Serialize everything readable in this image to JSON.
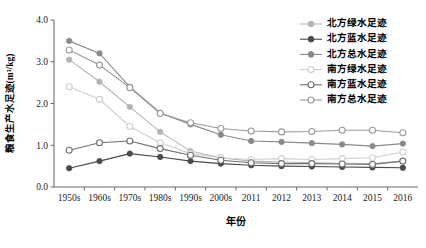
{
  "chart_data": {
    "type": "line",
    "title": "",
    "xlabel": "年份",
    "ylabel": "粮食生产水足迹(m³/kg)",
    "categories": [
      "1950s",
      "1960s",
      "1970s",
      "1980s",
      "1990s",
      "2000s",
      "2011",
      "2012",
      "2013",
      "2014",
      "2015",
      "2016"
    ],
    "ylim": [
      0.0,
      4.0
    ],
    "ytick_labels": [
      "0.0",
      "1.0",
      "2.0",
      "3.0",
      "4.0"
    ],
    "ytick_values": [
      0.0,
      1.0,
      2.0,
      3.0,
      4.0
    ],
    "grid": false,
    "legend_position": "top-right",
    "series": [
      {
        "name": "北方绿水足迹",
        "color": "#b4b4b4",
        "marker": "filled-circle",
        "values": [
          3.05,
          2.52,
          1.92,
          1.32,
          0.86,
          0.7,
          0.62,
          0.6,
          0.58,
          0.57,
          0.56,
          0.62
        ]
      },
      {
        "name": "北方蓝水足迹",
        "color": "#4a4a4a",
        "marker": "filled-circle",
        "values": [
          0.45,
          0.62,
          0.8,
          0.72,
          0.62,
          0.56,
          0.52,
          0.5,
          0.49,
          0.48,
          0.47,
          0.46
        ]
      },
      {
        "name": "北方总水足迹",
        "color": "#8a8a8a",
        "marker": "filled-circle",
        "values": [
          3.5,
          3.2,
          2.4,
          1.78,
          1.5,
          1.25,
          1.1,
          1.08,
          1.05,
          1.02,
          0.98,
          1.04
        ]
      },
      {
        "name": "南方绿水足迹",
        "color": "#cfcfcf",
        "marker": "open-circle",
        "values": [
          2.4,
          2.1,
          1.45,
          1.06,
          0.8,
          0.7,
          0.66,
          0.68,
          0.66,
          0.68,
          0.7,
          0.84
        ]
      },
      {
        "name": "南方蓝水足迹",
        "color": "#707070",
        "marker": "open-circle",
        "values": [
          0.88,
          1.06,
          1.1,
          0.92,
          0.76,
          0.64,
          0.58,
          0.56,
          0.56,
          0.55,
          0.54,
          0.62
        ]
      },
      {
        "name": "南方总水足迹",
        "color": "#9a9a9a",
        "marker": "open-circle",
        "values": [
          3.28,
          2.92,
          2.38,
          1.76,
          1.54,
          1.4,
          1.34,
          1.32,
          1.33,
          1.36,
          1.36,
          1.3
        ]
      }
    ]
  },
  "axes": {
    "y_title": "粮食生产水足迹(m³/kg)",
    "x_title": "年份"
  },
  "legend": {
    "items": [
      {
        "label": "北方绿水足迹"
      },
      {
        "label": "北方蓝水足迹"
      },
      {
        "label": "北方总水足迹"
      },
      {
        "label": "南方绿水足迹"
      },
      {
        "label": "南方蓝水足迹"
      },
      {
        "label": "南方总水足迹"
      }
    ]
  }
}
